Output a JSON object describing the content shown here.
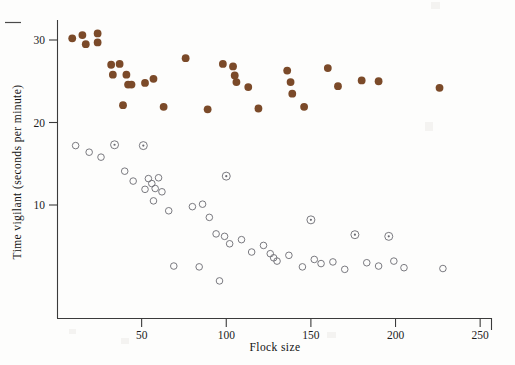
{
  "figure": {
    "background_color": "#fdfdfc",
    "axis_color": "#3b3b3b",
    "filled_color": "#7b4a29",
    "open_stroke_color": "#6b6b72",
    "corner_dash_label": "crop-mark-dash"
  },
  "axes": {
    "x": {
      "title": "Flock size",
      "ticks": [
        50,
        100,
        150,
        200,
        250
      ],
      "tick_labels": [
        "50",
        "100",
        "150",
        "200",
        "250"
      ],
      "range": [
        0,
        257
      ],
      "pixel_start": 57,
      "pixel_end": 492
    },
    "y": {
      "title": "Time vigilant (seconds per minute)",
      "ticks": [
        10,
        20,
        30
      ],
      "tick_labels": [
        "10",
        "20",
        "30"
      ],
      "range": [
        0.5,
        32.5
      ],
      "pixel_top": 20,
      "pixel_bottom": 318
    }
  },
  "chart_data": {
    "type": "scatter",
    "title": "",
    "xlabel": "Flock size",
    "ylabel": "Time vigilant (seconds per minute)",
    "xlim": [
      0,
      257
    ],
    "ylim": [
      0.5,
      32.5
    ],
    "xticks": [
      50,
      100,
      150,
      200,
      250
    ],
    "yticks": [
      10,
      20,
      30
    ],
    "grid": false,
    "legend": "none",
    "series": [
      {
        "name": "filled-brown-markers",
        "marker": "filled-circle",
        "color": "#7b4a29",
        "points": [
          [
            9,
            30.2
          ],
          [
            15,
            30.6
          ],
          [
            17,
            29.5
          ],
          [
            24,
            30.8
          ],
          [
            24,
            29.7
          ],
          [
            32,
            27.0
          ],
          [
            37,
            27.1
          ],
          [
            33,
            25.8
          ],
          [
            41,
            25.8
          ],
          [
            42,
            24.6
          ],
          [
            44,
            24.6
          ],
          [
            39,
            22.1
          ],
          [
            52,
            24.8
          ],
          [
            57,
            25.3
          ],
          [
            63,
            21.9
          ],
          [
            76,
            27.8
          ],
          [
            89,
            21.6
          ],
          [
            98,
            27.1
          ],
          [
            104,
            26.8
          ],
          [
            105,
            25.7
          ],
          [
            106,
            24.9
          ],
          [
            113,
            24.3
          ],
          [
            119,
            21.7
          ],
          [
            136,
            26.3
          ],
          [
            138,
            24.9
          ],
          [
            139,
            23.5
          ],
          [
            146,
            21.9
          ],
          [
            160,
            26.6
          ],
          [
            166,
            24.4
          ],
          [
            180,
            25.1
          ],
          [
            190,
            25.0
          ],
          [
            226,
            24.2
          ]
        ]
      },
      {
        "name": "open-circle-markers",
        "marker": "open-circle",
        "color": "#6b6b72",
        "points": [
          [
            11,
            17.2
          ],
          [
            19,
            16.4
          ],
          [
            26,
            15.8
          ],
          [
            34,
            17.3
          ],
          [
            40,
            14.1
          ],
          [
            52,
            11.9
          ],
          [
            57,
            10.5
          ],
          [
            45,
            12.9
          ],
          [
            54,
            13.2
          ],
          [
            56,
            12.6
          ],
          [
            58,
            12.0
          ],
          [
            60,
            13.3
          ],
          [
            51,
            17.2
          ],
          [
            62,
            11.6
          ],
          [
            66,
            9.3
          ],
          [
            80,
            9.8
          ],
          [
            86,
            10.1
          ],
          [
            90,
            8.5
          ],
          [
            94,
            6.5
          ],
          [
            99,
            6.2
          ],
          [
            102,
            5.3
          ],
          [
            109,
            5.8
          ],
          [
            100,
            13.5
          ],
          [
            115,
            4.3
          ],
          [
            122,
            5.1
          ],
          [
            126,
            4.1
          ],
          [
            128,
            3.6
          ],
          [
            130,
            3.2
          ],
          [
            137,
            3.9
          ],
          [
            145,
            2.5
          ],
          [
            150,
            8.2
          ],
          [
            152,
            3.4
          ],
          [
            156,
            2.9
          ],
          [
            163,
            3.1
          ],
          [
            170,
            2.2
          ],
          [
            176,
            6.4
          ],
          [
            183,
            3.0
          ],
          [
            190,
            2.6
          ],
          [
            196,
            6.2
          ],
          [
            199,
            3.2
          ],
          [
            205,
            2.4
          ],
          [
            228,
            2.3
          ],
          [
            96,
            0.8
          ],
          [
            69,
            2.6
          ],
          [
            84,
            2.5
          ]
        ]
      }
    ],
    "special_markers": {
      "name": "dot-in-circle-markers",
      "description": "open circles rendered with a small centre dot",
      "points": [
        [
          34,
          17.3
        ],
        [
          51,
          17.2
        ],
        [
          100,
          13.5
        ],
        [
          150,
          8.2
        ],
        [
          176,
          6.4
        ],
        [
          196,
          6.2
        ]
      ]
    }
  }
}
